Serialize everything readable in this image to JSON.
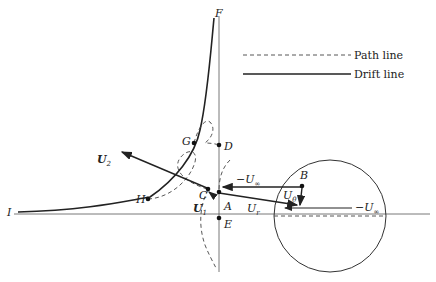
{
  "legend": {
    "items": [
      {
        "label": "Path line",
        "style": "dashed"
      },
      {
        "label": "Drift line",
        "style": "solid"
      }
    ]
  },
  "points": {
    "F": "F",
    "D": "D",
    "G": "G",
    "H": "H",
    "C": "C",
    "A": "A",
    "E": "E",
    "B": "B",
    "I": "I"
  },
  "vectors": {
    "U2": "U",
    "U2_sub": "2",
    "U1": "U",
    "U1_sub": "1",
    "minus_Uinf_top": "−U",
    "minus_Uinf_top_sub": "∞",
    "U_theta": "U",
    "U_theta_sub": "θ",
    "U_r": "U",
    "U_r_sub": "r",
    "minus_Uinf_circle": "−U",
    "minus_Uinf_circle_sub": "∞"
  },
  "colors": {
    "ink": "#222222"
  }
}
